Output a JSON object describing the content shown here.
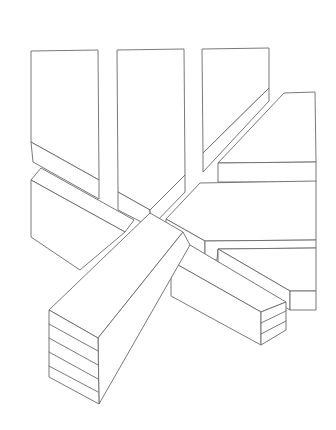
{
  "figure": {
    "background": "#ffffff",
    "stroke_color": "#6a6a6a",
    "blocks": [
      {
        "name": "left-upright-block",
        "faces": [
          [
            [
              31,
              51
            ],
            [
              98,
              50
            ],
            [
              99,
              180
            ],
            [
              31,
              142
            ]
          ],
          [
            [
              31,
              142
            ],
            [
              99,
              180
            ],
            [
              99,
              199
            ],
            [
              33,
              162
            ]
          ]
        ]
      },
      {
        "name": "middle-upright-block",
        "faces": [
          [
            [
              117,
              50
            ],
            [
              184,
              49
            ],
            [
              185,
              175
            ],
            [
              150,
              210
            ],
            [
              118,
              192
            ]
          ],
          [
            [
              118,
              192
            ],
            [
              150,
              210
            ],
            [
              151,
              227
            ],
            [
              118,
              210
            ]
          ],
          [
            [
              150,
              210
            ],
            [
              185,
              175
            ],
            [
              185,
              192
            ],
            [
              151,
              227
            ]
          ]
        ]
      },
      {
        "name": "right-upright-block",
        "faces": [
          [
            [
              202,
              49
            ],
            [
              269,
              48
            ],
            [
              269,
              88
            ],
            [
              203,
              153
            ]
          ],
          [
            [
              203,
              153
            ],
            [
              269,
              88
            ],
            [
              269,
              101
            ],
            [
              203,
              172
            ]
          ]
        ]
      },
      {
        "name": "upper-right-slab",
        "faces": [
          [
            [
              284,
              93
            ],
            [
              315,
              92
            ],
            [
              316,
              162
            ],
            [
              218,
              163
            ]
          ],
          [
            [
              218,
              163
            ],
            [
              316,
              162
            ],
            [
              316,
              182
            ],
            [
              218,
              182
            ]
          ]
        ]
      },
      {
        "name": "left-back-block",
        "faces": [
          [
            [
              41,
              168
            ],
            [
              134,
              220
            ],
            [
              125,
              232
            ],
            [
              31,
              180
            ]
          ],
          [
            [
              31,
              180
            ],
            [
              125,
              232
            ],
            [
              80,
              270
            ],
            [
              31,
              237
            ]
          ]
        ]
      },
      {
        "name": "middle-arrow-slab",
        "faces": [
          [
            [
              200,
              183
            ],
            [
              316,
              181
            ],
            [
              316,
              240
            ],
            [
              205,
              241
            ],
            [
              166,
              219
            ]
          ],
          [
            [
              166,
              219
            ],
            [
              205,
              241
            ],
            [
              205,
              260
            ],
            [
              166,
              238
            ]
          ],
          [
            [
              205,
              241
            ],
            [
              316,
              240
            ],
            [
              316,
              248
            ],
            [
              218,
              249
            ],
            [
              217,
              260
            ],
            [
              205,
              260
            ]
          ]
        ]
      },
      {
        "name": "lower-right-slab",
        "faces": [
          [
            [
              218,
              249
            ],
            [
              316,
              248
            ],
            [
              316,
              291
            ],
            [
              290,
              291
            ]
          ],
          [
            [
              218,
              249
            ],
            [
              290,
              291
            ],
            [
              290,
              310
            ],
            [
              218,
              268
            ]
          ],
          [
            [
              290,
              291
            ],
            [
              316,
              291
            ],
            [
              316,
              310
            ],
            [
              290,
              310
            ]
          ]
        ]
      },
      {
        "name": "lower-right-block",
        "faces": [
          [
            [
              171,
              261
            ],
            [
              190,
              245
            ],
            [
              286,
              302
            ],
            [
              261,
              312
            ]
          ],
          [
            [
              171,
              261
            ],
            [
              261,
              312
            ],
            [
              261,
              345
            ],
            [
              171,
              296
            ]
          ],
          [
            [
              261,
              312
            ],
            [
              286,
              302
            ],
            [
              286,
              330
            ],
            [
              261,
              345
            ]
          ]
        ],
        "layer_lines": [
          [
            [
              261,
              323
            ],
            [
              286,
              311
            ]
          ],
          [
            [
              261,
              334
            ],
            [
              286,
              321
            ]
          ]
        ]
      },
      {
        "name": "front-beam",
        "faces": [
          [
            [
              49,
              310
            ],
            [
              150,
              213
            ],
            [
              183,
              232
            ],
            [
              98,
              338
            ]
          ],
          [
            [
              98,
              338
            ],
            [
              183,
              232
            ],
            [
              190,
              245
            ],
            [
              99,
              404
            ]
          ],
          [
            [
              49,
              310
            ],
            [
              98,
              338
            ],
            [
              99,
              404
            ],
            [
              49,
              377
            ]
          ]
        ],
        "layer_lines": [
          [
            [
              49,
              324
            ],
            [
              98,
              351
            ]
          ],
          [
            [
              49,
              338
            ],
            [
              98,
              365
            ]
          ],
          [
            [
              49,
              352
            ],
            [
              98,
              379
            ]
          ],
          [
            [
              49,
              366
            ],
            [
              98,
              392
            ]
          ]
        ]
      }
    ]
  }
}
